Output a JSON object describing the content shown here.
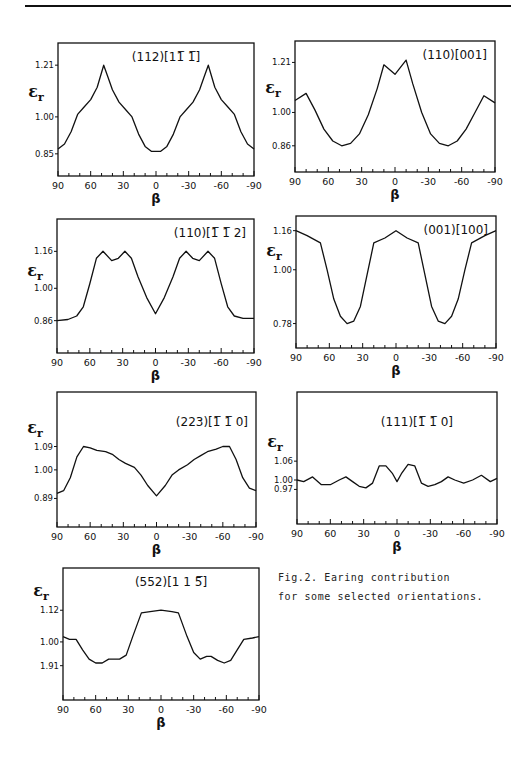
{
  "figure": {
    "caption_line1": "Fig.2. Earing contribution",
    "caption_line2": "for some selected orientations.",
    "ylabel": "εr",
    "xlabel": "β",
    "x_tick_labels": [
      "90",
      "60",
      "30",
      "0",
      "-30",
      "-60",
      "-90"
    ]
  },
  "chart_data": [
    {
      "type": "line",
      "title": "(112)[11-1]",
      "title_display": "(112)[11̅ 1̅]",
      "xlabel": "β",
      "ylabel": "εr",
      "x_ticks": [
        90,
        60,
        30,
        0,
        -30,
        -60,
        -90
      ],
      "y_ticks": [
        1.21,
        1.0,
        0.85
      ],
      "y_tick_labels": [
        "1.21",
        "1.00",
        "0.85"
      ],
      "xlim": [
        90,
        -90
      ],
      "ylim": [
        0.76,
        1.3
      ],
      "box": {
        "x": 58,
        "y": 43,
        "w": 196,
        "h": 133
      },
      "x": [
        90,
        84,
        78,
        72,
        66,
        60,
        54,
        48,
        44,
        40,
        34,
        28,
        22,
        16,
        10,
        4,
        0,
        -4,
        -10,
        -16,
        -22,
        -28,
        -34,
        -40,
        -44,
        -48,
        -54,
        -60,
        -66,
        -72,
        -78,
        -84,
        -90
      ],
      "y": [
        0.87,
        0.89,
        0.94,
        1.01,
        1.04,
        1.07,
        1.12,
        1.21,
        1.16,
        1.11,
        1.06,
        1.03,
        1.0,
        0.93,
        0.88,
        0.86,
        0.86,
        0.86,
        0.88,
        0.93,
        1.0,
        1.03,
        1.06,
        1.11,
        1.16,
        1.21,
        1.12,
        1.07,
        1.04,
        1.01,
        0.94,
        0.89,
        0.87
      ]
    },
    {
      "type": "line",
      "title": "(110)[001]",
      "title_display": "(110)[001]",
      "xlabel": "β",
      "ylabel": "εr",
      "x_ticks": [
        90,
        60,
        30,
        0,
        -30,
        -60,
        -90
      ],
      "x_tick_labels_shown": [
        "90",
        "60",
        "30",
        "0",
        "-30",
        "-60",
        "-90"
      ],
      "y_ticks": [
        1.21,
        1.0,
        0.86
      ],
      "y_tick_labels": [
        "1.21",
        "1.00",
        "0.86"
      ],
      "xlim": [
        90,
        -90
      ],
      "ylim": [
        0.75,
        1.3
      ],
      "box": {
        "x": 295,
        "y": 41,
        "w": 200,
        "h": 131
      },
      "x": [
        90,
        80,
        72,
        64,
        56,
        48,
        40,
        32,
        24,
        16,
        10,
        0,
        -10,
        -16,
        -24,
        -32,
        -40,
        -48,
        -56,
        -64,
        -72,
        -80,
        -90
      ],
      "y": [
        1.05,
        1.08,
        1.01,
        0.93,
        0.88,
        0.86,
        0.87,
        0.91,
        0.99,
        1.1,
        1.2,
        1.16,
        1.22,
        1.12,
        1.0,
        0.91,
        0.87,
        0.86,
        0.88,
        0.93,
        1.0,
        1.07,
        1.04
      ]
    },
    {
      "type": "line",
      "title": "(110)[1-12]",
      "title_display": "(110)[1̅ 1̅ 2]",
      "xlabel": "β",
      "ylabel": "εr",
      "x_ticks": [
        90,
        60,
        30,
        0,
        -30,
        -60,
        -90
      ],
      "y_ticks": [
        1.16,
        1.0,
        0.86
      ],
      "y_tick_labels": [
        "1.16",
        "1.00",
        "0.86"
      ],
      "xlim": [
        90,
        -90
      ],
      "ylim": [
        0.72,
        1.3
      ],
      "box": {
        "x": 57,
        "y": 219,
        "w": 197,
        "h": 134
      },
      "x": [
        90,
        80,
        72,
        66,
        60,
        54,
        48,
        40,
        34,
        28,
        22,
        16,
        8,
        0,
        -8,
        -16,
        -22,
        -28,
        -34,
        -40,
        -48,
        -54,
        -60,
        -66,
        -72,
        -80,
        -90
      ],
      "y": [
        0.86,
        0.865,
        0.88,
        0.92,
        1.02,
        1.13,
        1.16,
        1.12,
        1.13,
        1.16,
        1.13,
        1.05,
        0.96,
        0.89,
        0.96,
        1.05,
        1.13,
        1.16,
        1.13,
        1.12,
        1.16,
        1.13,
        1.02,
        0.92,
        0.88,
        0.87,
        0.87
      ]
    },
    {
      "type": "line",
      "title": "(001)[100]",
      "title_display": "(001)[100]",
      "xlabel": "β",
      "ylabel": "εr",
      "x_ticks": [
        90,
        60,
        30,
        0,
        -30,
        -60,
        -90
      ],
      "y_ticks": [
        1.16,
        1.0,
        0.78
      ],
      "y_tick_labels": [
        "1.16",
        "1.00",
        "0.78"
      ],
      "xlim": [
        90,
        -90
      ],
      "ylim": [
        0.68,
        1.22
      ],
      "box": {
        "x": 296,
        "y": 216,
        "w": 200,
        "h": 132
      },
      "x": [
        90,
        80,
        68,
        62,
        56,
        50,
        44,
        38,
        32,
        26,
        20,
        10,
        0,
        -10,
        -20,
        -26,
        -32,
        -38,
        -44,
        -50,
        -56,
        -62,
        -68,
        -80,
        -90
      ],
      "y": [
        1.16,
        1.14,
        1.11,
        1.0,
        0.88,
        0.81,
        0.78,
        0.79,
        0.85,
        0.98,
        1.11,
        1.13,
        1.16,
        1.13,
        1.11,
        0.98,
        0.85,
        0.79,
        0.78,
        0.81,
        0.88,
        1.0,
        1.11,
        1.14,
        1.16
      ]
    },
    {
      "type": "line",
      "title": "(223)[1-10]",
      "title_display": "(223)[1̅ 1̅ 0]",
      "xlabel": "β",
      "ylabel": "εr",
      "x_ticks": [
        90,
        60,
        30,
        0,
        -30,
        -60,
        -90
      ],
      "y_ticks": [
        1.09,
        1.0,
        0.89
      ],
      "y_tick_labels": [
        "1.09",
        "1.00",
        "0.89"
      ],
      "xlim": [
        90,
        -90
      ],
      "ylim": [
        0.78,
        1.3
      ],
      "box": {
        "x": 57,
        "y": 392,
        "w": 199,
        "h": 135
      },
      "x": [
        90,
        84,
        78,
        72,
        66,
        60,
        54,
        46,
        40,
        34,
        28,
        20,
        14,
        8,
        0,
        -8,
        -14,
        -20,
        -28,
        -34,
        -40,
        -46,
        -54,
        -60,
        -66,
        -72,
        -78,
        -84,
        -90
      ],
      "y": [
        0.91,
        0.92,
        0.97,
        1.05,
        1.09,
        1.085,
        1.075,
        1.07,
        1.06,
        1.04,
        1.025,
        1.01,
        0.98,
        0.94,
        0.9,
        0.94,
        0.98,
        1.0,
        1.02,
        1.04,
        1.055,
        1.07,
        1.08,
        1.09,
        1.09,
        1.04,
        0.97,
        0.93,
        0.92
      ]
    },
    {
      "type": "line",
      "title": "(111)[1-10]",
      "title_display": "(111)[1̅ 1̅ 0]",
      "xlabel": "β",
      "ylabel": "εr",
      "x_ticks": [
        90,
        60,
        30,
        0,
        -30,
        -60,
        -90
      ],
      "y_ticks": [
        1.06,
        1.0,
        0.97
      ],
      "y_tick_labels": [
        "1.06",
        "1.00",
        "0.97"
      ],
      "xlim": [
        90,
        -90
      ],
      "ylim": [
        0.86,
        1.28
      ],
      "box": {
        "x": 297,
        "y": 392,
        "w": 200,
        "h": 132
      },
      "x": [
        90,
        84,
        76,
        68,
        60,
        52,
        46,
        40,
        34,
        28,
        22,
        16,
        10,
        4,
        0,
        -4,
        -10,
        -16,
        -22,
        -28,
        -34,
        -40,
        -46,
        -52,
        -60,
        -68,
        -76,
        -84,
        -90
      ],
      "y": [
        1.0,
        0.995,
        1.01,
        0.985,
        0.985,
        1.0,
        1.01,
        0.995,
        0.98,
        0.975,
        0.99,
        1.045,
        1.045,
        1.02,
        0.995,
        1.02,
        1.05,
        1.045,
        0.99,
        0.98,
        0.985,
        0.995,
        1.01,
        1.0,
        0.99,
        1.0,
        1.015,
        0.995,
        1.005
      ]
    },
    {
      "type": "line",
      "title": "(552)[11-5]",
      "title_display": "(552)[1 1 5̅]",
      "xlabel": "β",
      "ylabel": "εr",
      "x_ticks": [
        90,
        60,
        30,
        0,
        -30,
        -60,
        -90
      ],
      "y_ticks": [
        1.12,
        1.0,
        0.91
      ],
      "y_tick_labels": [
        "1.12",
        "1.00",
        "1.91"
      ],
      "xlim": [
        90,
        -90
      ],
      "ylim": [
        0.78,
        1.28
      ],
      "box": {
        "x": 63,
        "y": 568,
        "w": 196,
        "h": 132
      },
      "x": [
        90,
        84,
        78,
        72,
        66,
        60,
        54,
        48,
        44,
        38,
        32,
        26,
        18,
        10,
        0,
        -10,
        -16,
        -24,
        -30,
        -36,
        -42,
        -46,
        -52,
        -58,
        -64,
        -70,
        -76,
        -84,
        -90
      ],
      "y": [
        1.02,
        1.01,
        1.01,
        0.97,
        0.935,
        0.92,
        0.92,
        0.935,
        0.935,
        0.935,
        0.95,
        1.02,
        1.11,
        1.115,
        1.12,
        1.115,
        1.11,
        1.02,
        0.96,
        0.935,
        0.945,
        0.945,
        0.93,
        0.92,
        0.93,
        0.97,
        1.01,
        1.015,
        1.02
      ]
    }
  ]
}
